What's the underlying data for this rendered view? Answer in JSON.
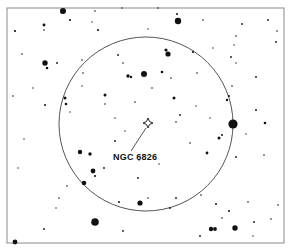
{
  "chart_data": {
    "type": "scatter",
    "title": "",
    "subtitle": "",
    "xlabel": "",
    "ylabel": "",
    "grid": false,
    "legend_position": "none",
    "frame": {
      "x": 7,
      "y": 8,
      "width": 277,
      "height": 235,
      "stroke": "#8a8a8a",
      "stroke_width": 1,
      "fill": "#ffffff"
    },
    "fov_circle": {
      "cx": 146,
      "cy": 124,
      "r": 87,
      "stroke": "#555555",
      "stroke_width": 1,
      "fill": "none"
    },
    "target": {
      "name": "NGC 6826",
      "symbol": "four-pointed-diamond",
      "x": 148,
      "y": 123,
      "size": 5,
      "stroke": "#222222",
      "label_x": 113,
      "label_y": 153,
      "leader_line": {
        "x1": 146,
        "y1": 128,
        "x2": 131,
        "y2": 151,
        "stroke": "#555555"
      }
    },
    "star_color": "#111111",
    "stars": [
      {
        "x": 62,
        "y": 12,
        "r": 1.5
      },
      {
        "x": 15,
        "y": 31,
        "r": 1.1
      },
      {
        "x": 44,
        "y": 30,
        "r": 0.8
      },
      {
        "x": 92,
        "y": 22,
        "r": 0.7
      },
      {
        "x": 44,
        "y": 25,
        "r": 1.4
      },
      {
        "x": 63,
        "y": 11,
        "r": 3.0
      },
      {
        "x": 70,
        "y": 20,
        "r": 1.1
      },
      {
        "x": 95,
        "y": 11,
        "r": 0.8
      },
      {
        "x": 122,
        "y": 8,
        "r": 0.7
      },
      {
        "x": 158,
        "y": 8,
        "r": 0.8
      },
      {
        "x": 178,
        "y": 21,
        "r": 3.2
      },
      {
        "x": 177,
        "y": 14,
        "r": 1.0
      },
      {
        "x": 148,
        "y": 29,
        "r": 0.7
      },
      {
        "x": 203,
        "y": 20,
        "r": 0.8
      },
      {
        "x": 242,
        "y": 24,
        "r": 0.9
      },
      {
        "x": 268,
        "y": 20,
        "r": 0.9
      },
      {
        "x": 277,
        "y": 31,
        "r": 0.8
      },
      {
        "x": 276,
        "y": 42,
        "r": 0.9
      },
      {
        "x": 236,
        "y": 36,
        "r": 0.8
      },
      {
        "x": 234,
        "y": 45,
        "r": 0.7
      },
      {
        "x": 98,
        "y": 30,
        "r": 1.1
      },
      {
        "x": 47,
        "y": 68,
        "r": 1.3
      },
      {
        "x": 45,
        "y": 63,
        "r": 2.7
      },
      {
        "x": 57,
        "y": 63,
        "r": 0.9
      },
      {
        "x": 82,
        "y": 60,
        "r": 0.8
      },
      {
        "x": 118,
        "y": 55,
        "r": 0.9
      },
      {
        "x": 123,
        "y": 63,
        "r": 0.8
      },
      {
        "x": 144,
        "y": 74,
        "r": 3.0
      },
      {
        "x": 166,
        "y": 50,
        "r": 1.6
      },
      {
        "x": 168,
        "y": 54,
        "r": 2.6
      },
      {
        "x": 162,
        "y": 72,
        "r": 1.3
      },
      {
        "x": 193,
        "y": 52,
        "r": 1.1
      },
      {
        "x": 171,
        "y": 78,
        "r": 0.8
      },
      {
        "x": 128,
        "y": 76,
        "r": 1.7
      },
      {
        "x": 131,
        "y": 77,
        "r": 1.2
      },
      {
        "x": 197,
        "y": 73,
        "r": 0.8
      },
      {
        "x": 213,
        "y": 48,
        "r": 0.7
      },
      {
        "x": 231,
        "y": 57,
        "r": 0.9
      },
      {
        "x": 236,
        "y": 63,
        "r": 0.7
      },
      {
        "x": 256,
        "y": 77,
        "r": 0.9
      },
      {
        "x": 232,
        "y": 86,
        "r": 0.8
      },
      {
        "x": 83,
        "y": 73,
        "r": 0.8
      },
      {
        "x": 82,
        "y": 86,
        "r": 0.7
      },
      {
        "x": 45,
        "y": 105,
        "r": 1.0
      },
      {
        "x": 65,
        "y": 98,
        "r": 1.5
      },
      {
        "x": 66,
        "y": 104,
        "r": 1.3
      },
      {
        "x": 70,
        "y": 112,
        "r": 0.7
      },
      {
        "x": 105,
        "y": 95,
        "r": 1.5
      },
      {
        "x": 135,
        "y": 102,
        "r": 0.8
      },
      {
        "x": 105,
        "y": 104,
        "r": 0.8
      },
      {
        "x": 174,
        "y": 98,
        "r": 1.5
      },
      {
        "x": 227,
        "y": 100,
        "r": 1.2
      },
      {
        "x": 233,
        "y": 124,
        "r": 4.6
      },
      {
        "x": 229,
        "y": 96,
        "r": 1.0
      },
      {
        "x": 256,
        "y": 110,
        "r": 1.0
      },
      {
        "x": 265,
        "y": 123,
        "r": 1.3
      },
      {
        "x": 219,
        "y": 138,
        "r": 1.5
      },
      {
        "x": 222,
        "y": 135,
        "r": 1.0
      },
      {
        "x": 115,
        "y": 141,
        "r": 0.9
      },
      {
        "x": 176,
        "y": 122,
        "r": 0.8
      },
      {
        "x": 180,
        "y": 115,
        "r": 0.9
      },
      {
        "x": 190,
        "y": 143,
        "r": 0.8
      },
      {
        "x": 207,
        "y": 153,
        "r": 1.4
      },
      {
        "x": 236,
        "y": 157,
        "r": 0.9
      },
      {
        "x": 264,
        "y": 155,
        "r": 0.8
      },
      {
        "x": 80,
        "y": 152,
        "r": 2.2
      },
      {
        "x": 90,
        "y": 154,
        "r": 1.7
      },
      {
        "x": 95,
        "y": 176,
        "r": 1.1
      },
      {
        "x": 84,
        "y": 183,
        "r": 2.3
      },
      {
        "x": 93,
        "y": 171,
        "r": 2.4
      },
      {
        "x": 104,
        "y": 168,
        "r": 0.9
      },
      {
        "x": 67,
        "y": 186,
        "r": 0.8
      },
      {
        "x": 138,
        "y": 178,
        "r": 0.9
      },
      {
        "x": 59,
        "y": 198,
        "r": 0.8
      },
      {
        "x": 56,
        "y": 208,
        "r": 0.7
      },
      {
        "x": 119,
        "y": 202,
        "r": 1.0
      },
      {
        "x": 148,
        "y": 198,
        "r": 0.8
      },
      {
        "x": 140,
        "y": 203,
        "r": 2.6
      },
      {
        "x": 170,
        "y": 208,
        "r": 0.9
      },
      {
        "x": 176,
        "y": 198,
        "r": 0.9
      },
      {
        "x": 201,
        "y": 195,
        "r": 0.8
      },
      {
        "x": 216,
        "y": 204,
        "r": 1.0
      },
      {
        "x": 229,
        "y": 211,
        "r": 1.0
      },
      {
        "x": 222,
        "y": 218,
        "r": 0.8
      },
      {
        "x": 248,
        "y": 202,
        "r": 0.8
      },
      {
        "x": 271,
        "y": 219,
        "r": 0.8
      },
      {
        "x": 95,
        "y": 222,
        "r": 3.8
      },
      {
        "x": 123,
        "y": 231,
        "r": 0.9
      },
      {
        "x": 44,
        "y": 229,
        "r": 0.9
      },
      {
        "x": 15,
        "y": 242,
        "r": 2.4
      },
      {
        "x": 211,
        "y": 229,
        "r": 2.2
      },
      {
        "x": 215,
        "y": 229,
        "r": 1.9
      },
      {
        "x": 235,
        "y": 228,
        "r": 2.7
      },
      {
        "x": 254,
        "y": 222,
        "r": 0.9
      },
      {
        "x": 200,
        "y": 236,
        "r": 0.9
      },
      {
        "x": 253,
        "y": 236,
        "r": 0.7
      },
      {
        "x": 278,
        "y": 205,
        "r": 0.8
      },
      {
        "x": 24,
        "y": 139,
        "r": 0.7
      },
      {
        "x": 18,
        "y": 168,
        "r": 0.7
      },
      {
        "x": 13,
        "y": 96,
        "r": 0.8
      },
      {
        "x": 22,
        "y": 54,
        "r": 0.8
      },
      {
        "x": 33,
        "y": 88,
        "r": 0.7
      },
      {
        "x": 152,
        "y": 88,
        "r": 0.8
      },
      {
        "x": 210,
        "y": 118,
        "r": 0.7
      },
      {
        "x": 196,
        "y": 106,
        "r": 0.7
      },
      {
        "x": 159,
        "y": 164,
        "r": 0.7
      },
      {
        "x": 139,
        "y": 160,
        "r": 0.7
      },
      {
        "x": 246,
        "y": 134,
        "r": 0.7
      },
      {
        "x": 115,
        "y": 118,
        "r": 0.7
      },
      {
        "x": 125,
        "y": 131,
        "r": 0.7
      }
    ]
  }
}
